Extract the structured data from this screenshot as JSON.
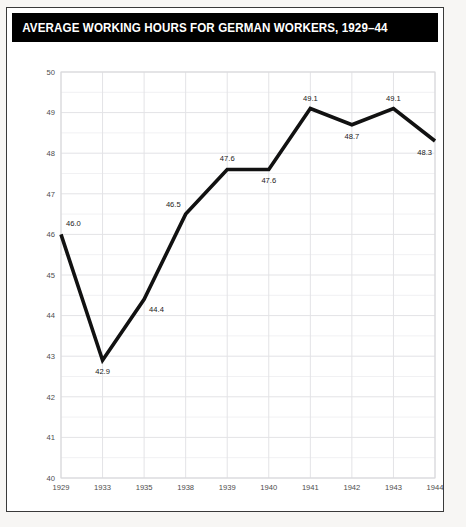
{
  "figure": {
    "title": "AVERAGE WORKING HOURS FOR GERMAN WORKERS, 1929–44",
    "title_background": "#000000",
    "title_color": "#ffffff",
    "background": "#ffffff",
    "page_background": "#f7f6f4"
  },
  "chart_data": {
    "type": "line",
    "title": "AVERAGE WORKING HOURS FOR GERMAN WORKERS, 1929–44",
    "xlabel": "",
    "ylabel": "",
    "categories": [
      "1929",
      "1933",
      "1935",
      "1938",
      "1939",
      "1940",
      "1941",
      "1942",
      "1943",
      "1944"
    ],
    "values": [
      46.0,
      42.9,
      44.4,
      46.5,
      47.6,
      47.6,
      49.1,
      48.7,
      49.1,
      48.3
    ],
    "point_labels": [
      "46.0",
      "42.9",
      "44.4",
      "46.5",
      "47.6",
      "47.6",
      "49.1",
      "48.7",
      "49.1",
      "48.3"
    ],
    "label_positions": [
      "above-right",
      "below",
      "below-right",
      "above-left",
      "above",
      "below",
      "above",
      "below",
      "above",
      "below-left"
    ],
    "ylim": [
      40,
      50
    ],
    "ytick_labels": [
      "40",
      "41",
      "42",
      "43",
      "44",
      "45",
      "46",
      "47",
      "48",
      "49",
      "50"
    ],
    "ytick_values": [
      40,
      41,
      42,
      43,
      44,
      45,
      46,
      47,
      48,
      49,
      50
    ],
    "grid": true,
    "minor_grid": true,
    "legend": "none",
    "line_color": "#111111",
    "grid_color": "#e3e3e6"
  }
}
